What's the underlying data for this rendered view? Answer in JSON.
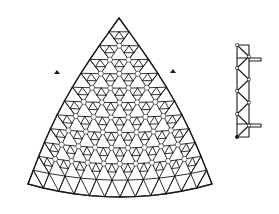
{
  "figure": {
    "colors": {
      "line": "#1a1a1a",
      "background": "#ffffff"
    }
  },
  "plan": {
    "apex": [
      119,
      18
    ],
    "bottom_left": [
      28,
      184
    ],
    "bottom_right": [
      212,
      184
    ],
    "bottom_sag_y": 197,
    "side_bulge": 10,
    "grid_rows": 12,
    "markers": [
      {
        "name": "left-marker",
        "x": 57,
        "y": 72
      },
      {
        "name": "right-marker",
        "x": 173,
        "y": 71
      }
    ]
  },
  "elevation": {
    "x_left": 237,
    "x_right": 249,
    "y_top": 45,
    "y_bottom": 137,
    "panels": 8,
    "outriggers": [
      {
        "y": 58,
        "x_end": 261
      },
      {
        "y": 124,
        "x_end": 261
      }
    ]
  }
}
